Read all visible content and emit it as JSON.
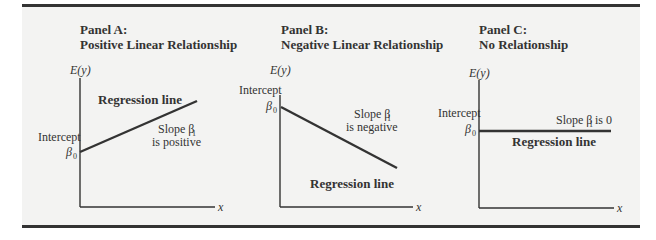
{
  "panels": [
    {
      "id": "A",
      "title": "Panel A:",
      "subtitle": "Positive Linear Relationship",
      "y_axis_label": "E(y)",
      "x_axis_label": "x",
      "intercept_label": "Intercept",
      "intercept_symbol": "β",
      "intercept_sub": "0",
      "regression_label": "Regression line",
      "slope_label": "Slope β",
      "slope_sub": "1",
      "slope_desc": "is positive"
    },
    {
      "id": "B",
      "title": "Panel B:",
      "subtitle": "Negative Linear Relationship",
      "y_axis_label": "E(y)",
      "x_axis_label": "x",
      "intercept_label": "Intercept",
      "intercept_symbol": "β",
      "intercept_sub": "0",
      "regression_label": "Regression line",
      "slope_label": "Slope β",
      "slope_sub": "1",
      "slope_desc": "is negative"
    },
    {
      "id": "C",
      "title": "Panel C:",
      "subtitle": "No Relationship",
      "y_axis_label": "E(y)",
      "x_axis_label": "x",
      "intercept_label": "Intercept",
      "intercept_symbol": "β",
      "intercept_sub": "0",
      "regression_label": "Regression line",
      "slope_label": "Slope β",
      "slope_sub": "1",
      "slope_desc": "is 0"
    }
  ],
  "colors": {
    "background": "#f3f3f2",
    "ink": "#333333"
  }
}
